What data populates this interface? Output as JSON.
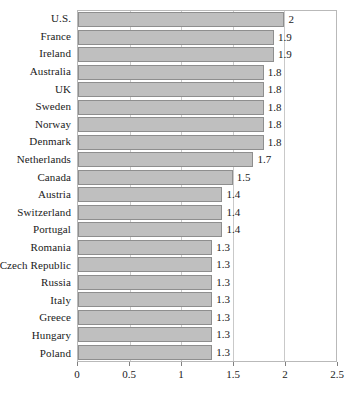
{
  "chart_data": {
    "type": "bar",
    "orientation": "horizontal",
    "title": "",
    "subtitle": "",
    "xlabel": "",
    "ylabel": "",
    "xlim": [
      0,
      2.5
    ],
    "xticks": [
      "0",
      "0.5",
      "1",
      "1.5",
      "2",
      "2.5"
    ],
    "xtick_values": [
      0,
      0.5,
      1,
      1.5,
      2,
      2.5
    ],
    "grid": true,
    "legend": "none",
    "bar_color": "#bfbfbf",
    "bar_border_color": "#8e8e8e",
    "plot_border_color": "#b9b9b9",
    "gridline_color": "#c9c9c9",
    "categories": [
      "U.S.",
      "France",
      "Ireland",
      "Australia",
      "UK",
      "Sweden",
      "Norway",
      "Denmark",
      "Netherlands",
      "Canada",
      "Austria",
      "Switzerland",
      "Portugal",
      "Romania",
      "Czech Republic",
      "Russia",
      "Italy",
      "Greece",
      "Hungary",
      "Poland"
    ],
    "values": [
      2,
      1.9,
      1.9,
      1.8,
      1.8,
      1.8,
      1.8,
      1.8,
      1.7,
      1.5,
      1.4,
      1.4,
      1.4,
      1.3,
      1.3,
      1.3,
      1.3,
      1.3,
      1.3,
      1.3
    ],
    "data_labels": [
      "2",
      "1.9",
      "1.9",
      "1.8",
      "1.8",
      "1.8",
      "1.8",
      "1.8",
      "1.7",
      "1.5",
      "1.4",
      "1.4",
      "1.4",
      "1.3",
      "1.3",
      "1.3",
      "1.3",
      "1.3",
      "1.3",
      "1.3"
    ]
  }
}
